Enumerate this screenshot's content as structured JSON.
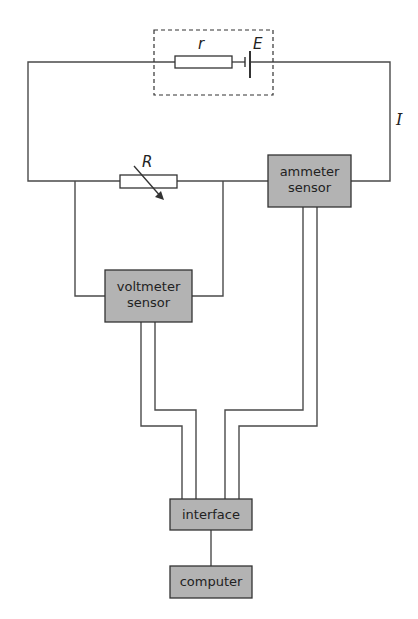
{
  "diagram": {
    "type": "circuit",
    "title": "",
    "components": {
      "internal_resistance": {
        "symbol": "r"
      },
      "emf": {
        "symbol": "E"
      },
      "variable_resistor": {
        "symbol": "R"
      },
      "current": {
        "symbol": "I"
      }
    },
    "boxes": {
      "ammeter": {
        "line1": "ammeter",
        "line2": "sensor"
      },
      "voltmeter": {
        "line1": "voltmeter",
        "line2": "sensor"
      },
      "interface": {
        "label": "interface"
      },
      "computer": {
        "label": "computer"
      }
    },
    "colors": {
      "box_fill": "#b3b3b3",
      "line": "#4a4a4a",
      "background": "#ffffff"
    }
  }
}
